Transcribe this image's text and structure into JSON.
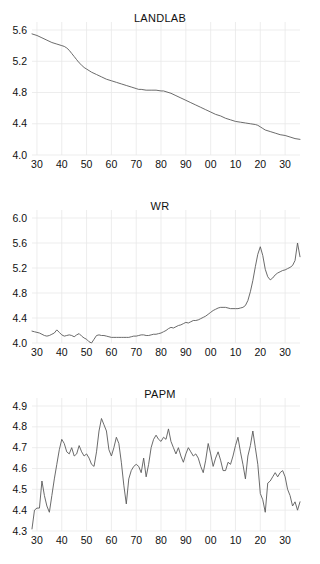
{
  "figure": {
    "background": "#ffffff",
    "line_color": "#5a5a5a",
    "grid_color": "#e8e8e8",
    "text_color": "#111111"
  },
  "chart_data": [
    {
      "type": "line",
      "title": "LANDLAB",
      "xlabel": "",
      "ylabel": "",
      "grid": true,
      "legend": "none",
      "xlim": [
        1928,
        2036
      ],
      "ylim": [
        4.0,
        5.6
      ],
      "xtick_values": [
        1930,
        1940,
        1950,
        1960,
        1970,
        1980,
        1990,
        2000,
        2010,
        2020,
        2030
      ],
      "xtick_labels": [
        "30",
        "40",
        "50",
        "60",
        "70",
        "80",
        "90",
        "00",
        "10",
        "20",
        "30"
      ],
      "ytick_values": [
        4.0,
        4.4,
        4.8,
        5.2,
        5.6
      ],
      "ytick_labels": [
        "4.0",
        "4.4",
        "4.8",
        "5.2",
        "5.6"
      ],
      "series": [
        {
          "name": "LANDLAB",
          "x": [
            1928,
            1930,
            1932,
            1934,
            1936,
            1938,
            1940,
            1941,
            1942,
            1943,
            1944,
            1945,
            1946,
            1947,
            1948,
            1949,
            1950,
            1951,
            1952,
            1954,
            1956,
            1958,
            1960,
            1962,
            1964,
            1966,
            1968,
            1970,
            1971,
            1972,
            1974,
            1976,
            1978,
            1980,
            1981,
            1982,
            1984,
            1986,
            1988,
            1990,
            1992,
            1994,
            1996,
            1998,
            2000,
            2002,
            2004,
            2006,
            2008,
            2010,
            2012,
            2014,
            2016,
            2018,
            2019,
            2020,
            2021,
            2022,
            2024,
            2026,
            2028,
            2030,
            2032,
            2034,
            2036
          ],
          "values": [
            5.55,
            5.53,
            5.5,
            5.47,
            5.44,
            5.42,
            5.4,
            5.39,
            5.37,
            5.34,
            5.3,
            5.26,
            5.22,
            5.18,
            5.15,
            5.12,
            5.1,
            5.08,
            5.06,
            5.03,
            5.0,
            4.97,
            4.95,
            4.93,
            4.91,
            4.89,
            4.87,
            4.85,
            4.84,
            4.84,
            4.83,
            4.83,
            4.83,
            4.82,
            4.82,
            4.81,
            4.79,
            4.76,
            4.73,
            4.7,
            4.67,
            4.64,
            4.61,
            4.58,
            4.55,
            4.52,
            4.5,
            4.47,
            4.45,
            4.43,
            4.42,
            4.41,
            4.4,
            4.39,
            4.38,
            4.36,
            4.34,
            4.32,
            4.3,
            4.28,
            4.26,
            4.25,
            4.23,
            4.21,
            4.2
          ]
        }
      ]
    },
    {
      "type": "line",
      "title": "WR",
      "xlabel": "",
      "ylabel": "",
      "grid": true,
      "legend": "none",
      "xlim": [
        1928,
        2036
      ],
      "ylim": [
        4.0,
        6.0
      ],
      "xtick_values": [
        1930,
        1940,
        1950,
        1960,
        1970,
        1980,
        1990,
        2000,
        2010,
        2020,
        2030
      ],
      "xtick_labels": [
        "30",
        "40",
        "50",
        "60",
        "70",
        "80",
        "90",
        "00",
        "10",
        "20",
        "30"
      ],
      "ytick_values": [
        4.0,
        4.4,
        4.8,
        5.2,
        5.6,
        6.0
      ],
      "ytick_labels": [
        "4.0",
        "4.4",
        "4.8",
        "5.2",
        "5.6",
        "6.0"
      ],
      "series": [
        {
          "name": "WR",
          "x": [
            1928,
            1929,
            1930,
            1931,
            1932,
            1933,
            1934,
            1935,
            1936,
            1937,
            1938,
            1939,
            1940,
            1941,
            1942,
            1943,
            1944,
            1945,
            1946,
            1947,
            1948,
            1949,
            1950,
            1951,
            1952,
            1953,
            1954,
            1955,
            1956,
            1957,
            1958,
            1959,
            1960,
            1961,
            1962,
            1963,
            1964,
            1965,
            1966,
            1967,
            1968,
            1969,
            1970,
            1971,
            1972,
            1973,
            1974,
            1975,
            1976,
            1977,
            1978,
            1979,
            1980,
            1981,
            1982,
            1983,
            1984,
            1985,
            1986,
            1987,
            1988,
            1989,
            1990,
            1991,
            1992,
            1993,
            1994,
            1995,
            1996,
            1997,
            1998,
            1999,
            2000,
            2001,
            2002,
            2003,
            2004,
            2005,
            2006,
            2007,
            2008,
            2009,
            2010,
            2011,
            2012,
            2013,
            2014,
            2015,
            2016,
            2017,
            2018,
            2019,
            2020,
            2021,
            2022,
            2023,
            2024,
            2025,
            2026,
            2027,
            2028,
            2029,
            2030,
            2031,
            2032,
            2033,
            2034,
            2035,
            2036
          ],
          "values": [
            4.19,
            4.18,
            4.17,
            4.16,
            4.14,
            4.12,
            4.11,
            4.12,
            4.14,
            4.16,
            4.21,
            4.17,
            4.13,
            4.11,
            4.12,
            4.13,
            4.12,
            4.1,
            4.13,
            4.15,
            4.11,
            4.08,
            4.06,
            4.02,
            4.0,
            4.06,
            4.12,
            4.13,
            4.12,
            4.12,
            4.11,
            4.1,
            4.09,
            4.09,
            4.09,
            4.09,
            4.09,
            4.09,
            4.09,
            4.09,
            4.1,
            4.11,
            4.11,
            4.12,
            4.13,
            4.13,
            4.12,
            4.12,
            4.13,
            4.14,
            4.14,
            4.15,
            4.16,
            4.18,
            4.2,
            4.23,
            4.25,
            4.24,
            4.26,
            4.28,
            4.29,
            4.31,
            4.33,
            4.32,
            4.34,
            4.36,
            4.36,
            4.37,
            4.39,
            4.41,
            4.43,
            4.46,
            4.49,
            4.52,
            4.54,
            4.56,
            4.57,
            4.57,
            4.57,
            4.56,
            4.55,
            4.55,
            4.55,
            4.55,
            4.56,
            4.57,
            4.6,
            4.68,
            4.82,
            5.0,
            5.22,
            5.42,
            5.54,
            5.4,
            5.18,
            5.06,
            5.01,
            5.04,
            5.09,
            5.12,
            5.14,
            5.16,
            5.17,
            5.19,
            5.21,
            5.24,
            5.32,
            5.6,
            5.38
          ]
        }
      ]
    },
    {
      "type": "line",
      "title": "PAPM",
      "xlabel": "",
      "ylabel": "",
      "grid": true,
      "legend": "none",
      "xlim": [
        1928,
        2036
      ],
      "ylim": [
        4.3,
        4.9
      ],
      "xtick_values": [
        1930,
        1940,
        1950,
        1960,
        1970,
        1980,
        1990,
        2000,
        2010,
        2020,
        2030
      ],
      "xtick_labels": [
        "30",
        "40",
        "50",
        "60",
        "70",
        "80",
        "90",
        "00",
        "10",
        "20",
        "30"
      ],
      "ytick_values": [
        4.3,
        4.4,
        4.5,
        4.6,
        4.7,
        4.8,
        4.9
      ],
      "ytick_labels": [
        "4.3",
        "4.4",
        "4.5",
        "4.6",
        "4.7",
        "4.8",
        "4.9"
      ],
      "series": [
        {
          "name": "PAPM",
          "x": [
            1928,
            1929,
            1930,
            1931,
            1932,
            1933,
            1934,
            1935,
            1936,
            1937,
            1938,
            1939,
            1940,
            1941,
            1942,
            1943,
            1944,
            1945,
            1946,
            1947,
            1948,
            1949,
            1950,
            1951,
            1952,
            1953,
            1954,
            1955,
            1956,
            1957,
            1958,
            1959,
            1960,
            1961,
            1962,
            1963,
            1964,
            1965,
            1966,
            1967,
            1968,
            1969,
            1970,
            1971,
            1972,
            1973,
            1974,
            1975,
            1976,
            1977,
            1978,
            1979,
            1980,
            1981,
            1982,
            1983,
            1984,
            1985,
            1986,
            1987,
            1988,
            1989,
            1990,
            1991,
            1992,
            1993,
            1994,
            1995,
            1996,
            1997,
            1998,
            1999,
            2000,
            2001,
            2002,
            2003,
            2004,
            2005,
            2006,
            2007,
            2008,
            2009,
            2010,
            2011,
            2012,
            2013,
            2014,
            2015,
            2016,
            2017,
            2018,
            2019,
            2020,
            2021,
            2022,
            2023,
            2024,
            2025,
            2026,
            2027,
            2028,
            2029,
            2030,
            2031,
            2032,
            2033,
            2034,
            2035,
            2036
          ],
          "values": [
            4.31,
            4.4,
            4.41,
            4.41,
            4.54,
            4.47,
            4.42,
            4.39,
            4.47,
            4.55,
            4.62,
            4.69,
            4.74,
            4.72,
            4.68,
            4.67,
            4.7,
            4.66,
            4.67,
            4.71,
            4.68,
            4.66,
            4.67,
            4.65,
            4.62,
            4.61,
            4.68,
            4.78,
            4.84,
            4.81,
            4.78,
            4.69,
            4.66,
            4.7,
            4.75,
            4.72,
            4.63,
            4.52,
            4.43,
            4.55,
            4.59,
            4.61,
            4.62,
            4.61,
            4.58,
            4.65,
            4.56,
            4.62,
            4.7,
            4.74,
            4.76,
            4.74,
            4.73,
            4.75,
            4.74,
            4.79,
            4.73,
            4.7,
            4.67,
            4.7,
            4.66,
            4.63,
            4.67,
            4.7,
            4.68,
            4.66,
            4.67,
            4.65,
            4.61,
            4.58,
            4.64,
            4.72,
            4.67,
            4.61,
            4.65,
            4.68,
            4.64,
            4.59,
            4.59,
            4.63,
            4.62,
            4.66,
            4.71,
            4.75,
            4.68,
            4.62,
            4.55,
            4.66,
            4.71,
            4.78,
            4.7,
            4.62,
            4.48,
            4.45,
            4.39,
            4.53,
            4.54,
            4.56,
            4.58,
            4.56,
            4.58,
            4.59,
            4.56,
            4.5,
            4.47,
            4.42,
            4.44,
            4.4,
            4.44
          ]
        }
      ]
    }
  ]
}
